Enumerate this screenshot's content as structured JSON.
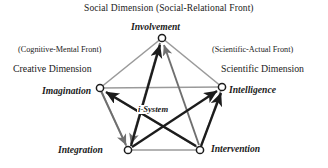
{
  "figure": {
    "title_top": "Social Dimension  (Social-Relational Front)",
    "fronts": {
      "left": "(Cognitive-Mental Front)",
      "right": "(Scientific-Actual Front)"
    },
    "dimensions": {
      "left": "Creative Dimension",
      "right": "Scientific Dimension"
    },
    "core_label": "i-System",
    "nodes": [
      {
        "id": "involvement",
        "label": "Involvement",
        "x": 162,
        "y": 38
      },
      {
        "id": "imagination",
        "label": "Imagination",
        "x": 100,
        "y": 88
      },
      {
        "id": "intelligence",
        "label": "Intelligence",
        "x": 222,
        "y": 87
      },
      {
        "id": "integration",
        "label": "Integration",
        "x": 128,
        "y": 150
      },
      {
        "id": "intervention",
        "label": "Intervention",
        "x": 200,
        "y": 150
      }
    ],
    "colors": {
      "outline_gray": "#9a9a9a",
      "mid_gray": "#6f6f6f",
      "dark": "#1c1c1c",
      "background": "#ffffff",
      "text": "#1a1a1a"
    }
  }
}
